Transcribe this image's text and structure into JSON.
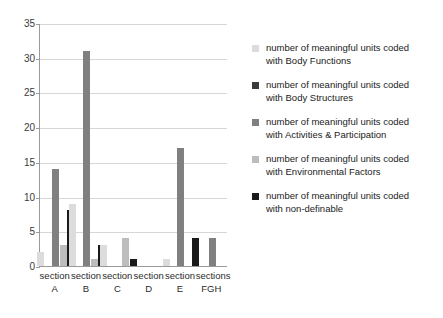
{
  "chart_data": {
    "type": "bar",
    "title": "",
    "subtitle": "",
    "xlabel": "",
    "ylabel": "",
    "ylim": [
      0,
      35
    ],
    "ytick_step": 5,
    "yticks": [
      0,
      5,
      10,
      15,
      20,
      25,
      30,
      35
    ],
    "grid": true,
    "legend_position": "right",
    "categories": [
      "section A",
      "section B",
      "section C",
      "section D",
      "section E",
      "sections FGH"
    ],
    "category_lines": [
      [
        "section",
        "A"
      ],
      [
        "section",
        "B"
      ],
      [
        "section",
        "C"
      ],
      [
        "section",
        "D"
      ],
      [
        "section",
        "E"
      ],
      [
        "sections",
        "FGH"
      ]
    ],
    "series": [
      {
        "name": "number of meaningful units coded with Body Functions",
        "label_lines": [
          "number of meaningful units",
          "coded with Body Functions"
        ],
        "color": "#dcdcdc",
        "values": [
          2,
          9,
          3,
          0,
          1,
          0
        ]
      },
      {
        "name": "number of meaningful units coded with Body Structures",
        "label_lines": [
          "number of meaningful units",
          "coded with Body Structures"
        ],
        "color": "#3a3a3a",
        "values": [
          0,
          0,
          0,
          0,
          0,
          0
        ]
      },
      {
        "name": "number of meaningful units coded with Activities & Participation",
        "label_lines": [
          "number of meaningful units",
          "coded with Activities &",
          "Participation"
        ],
        "color": "#808080",
        "values": [
          14,
          31,
          0,
          0,
          17,
          4
        ]
      },
      {
        "name": "number of meaningful units coded with Environmental Factors",
        "label_lines": [
          "number of meaningful units",
          "coded with Environmental",
          "Factors"
        ],
        "color": "#bdbdbd",
        "values": [
          3,
          1,
          4,
          0,
          0,
          0
        ]
      },
      {
        "name": "number of meaningful units coded with non-definable",
        "label_lines": [
          "number of meaningful units",
          "coded with non-definable"
        ],
        "color": "#1a1a1a",
        "values": [
          8,
          3,
          1,
          0,
          4,
          0
        ]
      }
    ]
  }
}
